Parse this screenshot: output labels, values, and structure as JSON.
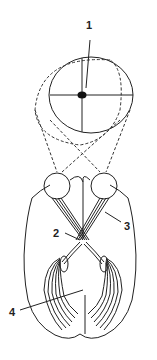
{
  "diagram": {
    "type": "anatomical-illustration",
    "labels": [
      {
        "id": "1",
        "text": "1",
        "x": 89,
        "y": 29
      },
      {
        "id": "2",
        "text": "2",
        "x": 55,
        "y": 234
      },
      {
        "id": "3",
        "text": "3",
        "x": 126,
        "y": 230
      },
      {
        "id": "4",
        "text": "4",
        "x": 10,
        "y": 315
      }
    ],
    "colors": {
      "stroke": "#222222",
      "background": "#ffffff"
    }
  }
}
